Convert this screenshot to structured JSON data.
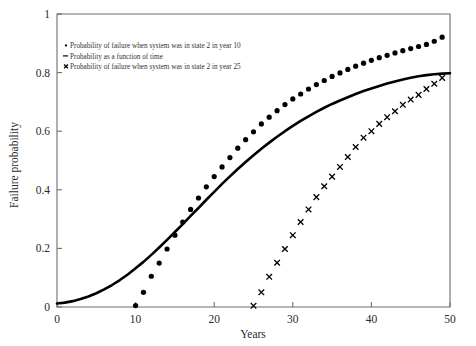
{
  "chart_data": {
    "type": "scatter",
    "title": "",
    "xlabel": "Years",
    "ylabel": "Failure probability",
    "xlim": [
      0,
      50
    ],
    "ylim": [
      0,
      1
    ],
    "grid": false,
    "legend_position": "upper-left-inside",
    "x_ticks": [
      "0",
      "10",
      "20",
      "30",
      "40",
      "50"
    ],
    "x_tick_values": [
      0,
      10,
      20,
      30,
      40,
      50
    ],
    "y_ticks": [
      "0",
      "0.2",
      "0.4",
      "0.6",
      "0.8",
      "1"
    ],
    "y_tick_values": [
      0,
      0.2,
      0.4,
      0.6,
      0.8,
      1
    ],
    "series": [
      {
        "name": "Probability of failure when system was in state 2 in year 10",
        "marker": "filled-circle",
        "color": "#000000",
        "x": [
          10,
          11,
          12,
          13,
          14,
          15,
          16,
          17,
          18,
          19,
          20,
          21,
          22,
          23,
          24,
          25,
          26,
          27,
          28,
          29,
          30,
          31,
          32,
          33,
          34,
          35,
          36,
          37,
          38,
          39,
          40,
          41,
          42,
          43,
          44,
          45,
          46,
          47,
          48,
          49
        ],
        "y": [
          0.005,
          0.05,
          0.105,
          0.15,
          0.198,
          0.245,
          0.29,
          0.333,
          0.372,
          0.41,
          0.445,
          0.478,
          0.51,
          0.542,
          0.571,
          0.598,
          0.625,
          0.648,
          0.67,
          0.691,
          0.71,
          0.727,
          0.744,
          0.759,
          0.773,
          0.787,
          0.799,
          0.811,
          0.822,
          0.832,
          0.842,
          0.851,
          0.859,
          0.867,
          0.875,
          0.882,
          0.889,
          0.896,
          0.907,
          0.921
        ]
      },
      {
        "name": "Probability as a function of time",
        "marker": "line",
        "color": "#000000",
        "x": [
          0,
          1,
          2,
          3,
          4,
          5,
          6,
          7,
          8,
          9,
          10,
          11,
          12,
          13,
          14,
          15,
          16,
          17,
          18,
          19,
          20,
          21,
          22,
          23,
          24,
          25,
          26,
          27,
          28,
          29,
          30,
          31,
          32,
          33,
          34,
          35,
          36,
          37,
          38,
          39,
          40,
          41,
          42,
          43,
          44,
          45,
          46,
          47,
          48,
          49,
          50
        ],
        "y": [
          0.012,
          0.015,
          0.02,
          0.027,
          0.036,
          0.047,
          0.06,
          0.075,
          0.092,
          0.111,
          0.132,
          0.154,
          0.178,
          0.203,
          0.229,
          0.256,
          0.283,
          0.311,
          0.338,
          0.366,
          0.393,
          0.42,
          0.446,
          0.471,
          0.495,
          0.518,
          0.54,
          0.561,
          0.581,
          0.6,
          0.618,
          0.635,
          0.651,
          0.666,
          0.68,
          0.693,
          0.705,
          0.716,
          0.727,
          0.737,
          0.746,
          0.7545,
          0.7625,
          0.77,
          0.7765,
          0.7825,
          0.7875,
          0.7915,
          0.7945,
          0.7965,
          0.798
        ]
      },
      {
        "name": "Probability of failure when system was in state 2 in year 25",
        "marker": "cross",
        "color": "#000000",
        "x": [
          25,
          26,
          27,
          28,
          29,
          30,
          31,
          32,
          33,
          34,
          35,
          36,
          37,
          38,
          39,
          40,
          41,
          42,
          43,
          44,
          45,
          46,
          47,
          48,
          49
        ],
        "y": [
          0.004,
          0.05,
          0.103,
          0.151,
          0.198,
          0.245,
          0.29,
          0.333,
          0.375,
          0.412,
          0.445,
          0.478,
          0.512,
          0.546,
          0.578,
          0.6,
          0.625,
          0.648,
          0.668,
          0.69,
          0.708,
          0.724,
          0.744,
          0.762,
          0.782
        ]
      }
    ],
    "legend": [
      {
        "marker_glyph": "dot",
        "label": "Probability of failure when system was in state 2 in year 10"
      },
      {
        "marker_glyph": "dash",
        "label": "Probability as a function of time"
      },
      {
        "marker_glyph": "cross",
        "label": "Probability of failure when system was in state 2 in year 25"
      }
    ]
  }
}
